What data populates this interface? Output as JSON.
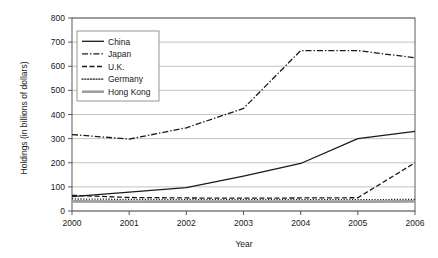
{
  "chart_data": {
    "type": "line",
    "title": "",
    "xlabel": "Year",
    "ylabel": "Holdings (in billions of dollars)",
    "x": [
      2000,
      2001,
      2002,
      2003,
      2004,
      2005,
      2006
    ],
    "xtick_labels": [
      "2000",
      "2001",
      "2002",
      "2003",
      "2004",
      "2005",
      "2006"
    ],
    "ytick_labels": [
      "0",
      "100",
      "200",
      "300",
      "400",
      "500",
      "600",
      "700",
      "800"
    ],
    "yticks": [
      0,
      100,
      200,
      300,
      400,
      500,
      600,
      700,
      800
    ],
    "ylim": [
      0,
      800
    ],
    "xlim": [
      2000,
      2006
    ],
    "grid": true,
    "legend_position": "upper-left-inside",
    "series": [
      {
        "name": "China",
        "style": "solid",
        "color": "#1a1a1a",
        "width": 1.3,
        "values": [
          60,
          78,
          97,
          145,
          197,
          300,
          330
        ]
      },
      {
        "name": "Japan",
        "style": "dashdot",
        "color": "#1a1a1a",
        "width": 1.3,
        "values": [
          317,
          298,
          345,
          425,
          665,
          665,
          635
        ]
      },
      {
        "name": "U.K.",
        "style": "dashed",
        "color": "#1a1a1a",
        "width": 1.3,
        "values": [
          65,
          56,
          54,
          53,
          54,
          55,
          200
        ]
      },
      {
        "name": "Germany",
        "style": "dotted",
        "color": "#1a1a1a",
        "width": 1.3,
        "values": [
          50,
          48,
          47,
          47,
          47,
          47,
          48
        ]
      },
      {
        "name": "Hong Kong",
        "style": "solid-thick",
        "color": "#9e9e9e",
        "width": 2.6,
        "values": [
          40,
          39,
          39,
          39,
          39,
          39,
          40
        ]
      }
    ]
  }
}
